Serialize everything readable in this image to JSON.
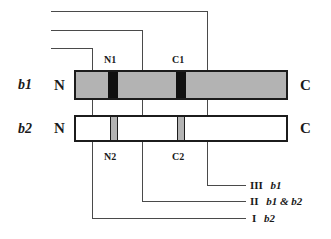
{
  "figure": {
    "title": "",
    "background_color": "#ffffff",
    "line_color": "#4a4a4a",
    "outline_color": "#1c1c1c"
  },
  "rows": [
    {
      "id": "b1",
      "label": "b1",
      "n_terminus": "N",
      "c_terminus": "C",
      "fill_color": "#b3b3b3",
      "domains": [
        {
          "id": "N1",
          "label": "N1",
          "style": "dark",
          "color": "#111111"
        },
        {
          "id": "C1",
          "label": "C1",
          "style": "dark",
          "color": "#111111"
        }
      ]
    },
    {
      "id": "b2",
      "label": "b2",
      "n_terminus": "N",
      "c_terminus": "C",
      "fill_color": "#ffffff",
      "domains": [
        {
          "id": "N2",
          "label": "N2",
          "style": "gray",
          "color": "#b3b3b3"
        },
        {
          "id": "C2",
          "label": "C2",
          "style": "gray",
          "color": "#b3b3b3"
        }
      ]
    }
  ],
  "domain_labels": {
    "n1": "N1",
    "c1": "C1",
    "n2": "N2",
    "c2": "C2"
  },
  "terminus_labels": {
    "b1_n": "N",
    "b1_c": "C",
    "b2_n": "N",
    "b2_c": "C"
  },
  "row_labels": {
    "b1": "b1",
    "b2": "b2"
  },
  "legend": {
    "items": [
      {
        "numeral": "III",
        "constructs": "b1"
      },
      {
        "numeral": "II",
        "constructs": "b1 & b2"
      },
      {
        "numeral": "I",
        "constructs": "b2"
      }
    ]
  }
}
